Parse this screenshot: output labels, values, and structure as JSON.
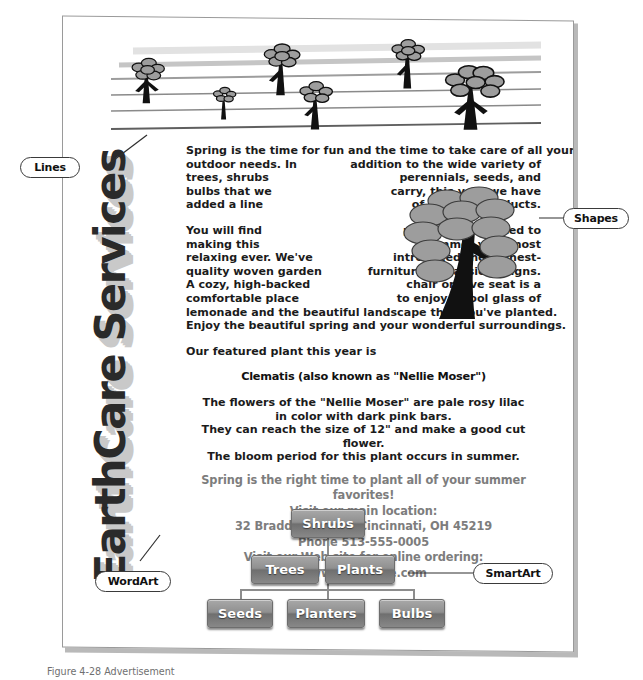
{
  "document": {
    "wordart": {
      "text": "EarthCare Services"
    },
    "paragraph1": {
      "line1": "Spring is the time for fun and the time to take care of all your",
      "rows": [
        {
          "left": "outdoor needs.  In",
          "right": "addition to the wide variety of"
        },
        {
          "left": "trees, shrubs",
          "right": "perennials, seeds, and"
        },
        {
          "left": "bulbs that we",
          "right": "carry, this year we have"
        },
        {
          "left": "added a line",
          "right": "of outdoor products."
        }
      ]
    },
    "paragraph2": {
      "rows": [
        {
          "left": "You will find",
          "right": "products dedicated to"
        },
        {
          "left": "making this",
          "right": "summer your most"
        },
        {
          "left": "relaxing ever.  We've",
          "right": "introduced the highest-"
        },
        {
          "left": "quality woven garden",
          "right": "furniture in classic designs."
        },
        {
          "left": "A cozy, high-backed",
          "right": "chair or love seat is a"
        },
        {
          "left": "comfortable place",
          "right": "to enjoy a cool glass of"
        }
      ],
      "line_last1": "lemonade and the beautiful landscape that you've planted.",
      "line_last2": "Enjoy the beautiful spring and your wonderful surroundings."
    },
    "featured_intro": "Our featured plant this year is",
    "featured_heading": "Clematis (also known as \"Nellie Moser\")",
    "plant_description": [
      "The flowers of the \"Nellie Moser\" are pale rosy lilac",
      "in color with dark pink bars.",
      "They can reach the size of 12\" and make a good cut flower.",
      "The bloom period for this plant occurs in summer."
    ],
    "promo": [
      "Spring is the right time to plant all of your summer favorites!",
      "Visit our main location:",
      "32 Braddoch Road, Cincinnati, OH 45219",
      "Phone 513-555-0005",
      "Visit our Web site for online ordering: www.earthcare.com"
    ]
  },
  "smartart": {
    "nodes": [
      {
        "label": "Shrubs"
      },
      {
        "label": "Trees"
      },
      {
        "label": "Plants"
      },
      {
        "label": "Seeds"
      },
      {
        "label": "Planters"
      },
      {
        "label": "Bulbs"
      }
    ]
  },
  "callouts": [
    {
      "label": "Lines"
    },
    {
      "label": "Shapes"
    },
    {
      "label": "WordArt"
    },
    {
      "label": "SmartArt"
    }
  ],
  "figure": {
    "caption": "Figure 4-28   Advertisement"
  },
  "colors": {
    "wordart_main": "#2a2a2a",
    "wordart_shadow": "#c9c9c9",
    "promo_text": "#7d7d7d",
    "smartart_box": "#8b8b8b",
    "tree_dark": "#111111",
    "leaf_gray": "#9d9d9d",
    "rule_line": "#8a8a8a"
  }
}
